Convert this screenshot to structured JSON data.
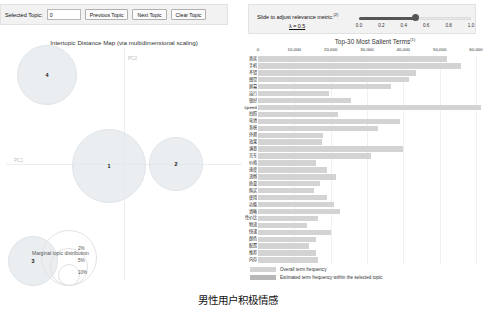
{
  "topic_controls": {
    "selected_topic_label": "Selected Topic:",
    "selected_topic_value": "0",
    "previous_topic_button": "Previous Topic",
    "next_topic_button": "Next Topic",
    "clear_topic_button": "Clear Topic"
  },
  "relevance_controls": {
    "title": "Slide to adjust relevance metric:",
    "title_superscript": "(2)",
    "lambda_label": "λ = 0.5",
    "lambda_value": 0.5,
    "ticks": [
      "0.0",
      "0.2",
      "0.4",
      "0.6",
      "0.8",
      "1.0"
    ]
  },
  "map": {
    "title": "Intertopic Distance Map (via multidimensional scaling)",
    "axis_labels": {
      "x": "PC1",
      "y": "PC2"
    },
    "topics": [
      {
        "id": "4",
        "cx": 41,
        "cy": 27,
        "r": 30
      },
      {
        "id": "1",
        "cx": 103,
        "cy": 118,
        "r": 37
      },
      {
        "id": "2",
        "cx": 170,
        "cy": 116,
        "r": 27
      },
      {
        "id": "3",
        "cx": 27,
        "cy": 213,
        "r": 25
      }
    ],
    "marginal_legend": {
      "title": "Marginal topic distribution",
      "ticks": [
        "2%",
        "5%",
        "10%"
      ]
    }
  },
  "bar_chart": {
    "title": "Top-30 Most Salient Terms",
    "title_superscript": "(1)",
    "legend": [
      {
        "label": "Overall term frequency",
        "color": "#d3d3d3"
      },
      {
        "label": "Estimated term frequency within the selected topic",
        "color": "#b8b8b8"
      }
    ]
  },
  "chart_data": {
    "type": "bar",
    "title": "Top-30 Most Salient Terms",
    "orientation": "horizontal",
    "xlabel": "",
    "ylabel": "",
    "xlim": [
      0,
      60000
    ],
    "grid": true,
    "legend_position": "bottom",
    "tick_labels": [
      "0",
      "10,000",
      "20,000",
      "30,000",
      "40,000",
      "50,000",
      "60,000"
    ],
    "tick_values": [
      0,
      10000,
      20000,
      30000,
      40000,
      50000,
      60000
    ],
    "categories": [
      "喜欢",
      "手机",
      "不错",
      "感觉",
      "屏幕",
      "运行",
      "很好",
      "speed",
      "拍照",
      "电池",
      "系统",
      "外观",
      "效果",
      "满意",
      "京东",
      "价格",
      "速度",
      "流畅",
      "质量",
      "购买",
      "使用",
      "功能",
      "清晰",
      "性价比",
      "物流",
      "快递",
      "颜色",
      "配置",
      "推荐",
      "内存"
    ],
    "series": [
      {
        "name": "Overall term frequency",
        "values": [
          52000,
          56000,
          43500,
          41500,
          36500,
          19500,
          25500,
          61500,
          22000,
          39000,
          33000,
          18000,
          17500,
          40000,
          31000,
          16000,
          19000,
          21500,
          17000,
          15500,
          19000,
          21000,
          22500,
          16500,
          13500,
          20000,
          16000,
          14000,
          16000,
          16500
        ]
      },
      {
        "name": "Estimated term frequency within the selected topic",
        "values": [
          0,
          0,
          0,
          0,
          0,
          0,
          0,
          0,
          0,
          0,
          0,
          0,
          0,
          0,
          0,
          0,
          0,
          0,
          0,
          0,
          0,
          0,
          0,
          0,
          0,
          0,
          0,
          0,
          0,
          0
        ]
      }
    ]
  },
  "caption": "男性用户积极情感"
}
